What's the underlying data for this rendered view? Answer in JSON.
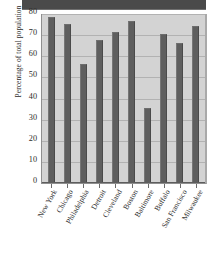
{
  "figure": {
    "top_band_present": true,
    "plot_background": "#d3d3d3",
    "bar_color": "#5e5e5e",
    "gridline_color": "#b2b2b2",
    "text_color": "#2b2b2b"
  },
  "chart_data": {
    "type": "bar",
    "title": "",
    "xlabel": "",
    "ylabel": "Percentage of total population",
    "categories": [
      "New York",
      "Chicago",
      "Philadelphia",
      "Detroit",
      "Cleveland",
      "Boston",
      "Baltimore",
      "Buffalo",
      "San Francisco",
      "Milwaukee"
    ],
    "values": [
      78,
      75,
      56,
      67,
      71,
      76,
      35,
      70,
      66,
      74
    ],
    "ylim": [
      0,
      80
    ],
    "yticks": [
      80,
      70,
      60,
      50,
      40,
      30,
      20,
      10,
      0
    ],
    "ytick_labels": [
      "80",
      "70",
      "60",
      "50",
      "40",
      "30",
      "20",
      "10",
      "0"
    ],
    "grid": true,
    "grid_axis": "y",
    "legend": false,
    "legend_position": "none"
  }
}
